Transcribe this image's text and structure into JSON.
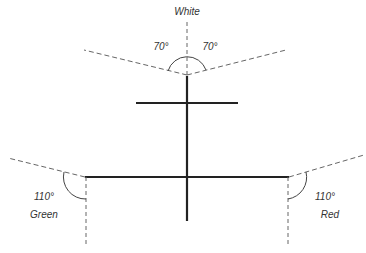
{
  "diagram": {
    "labels": {
      "top_light": "White",
      "left_light": "Green",
      "right_light": "Red",
      "top_left_angle": "70°",
      "top_right_angle": "70°",
      "left_angle": "110°",
      "right_angle": "110°"
    },
    "colors": {
      "solid_line": "#222222",
      "dashed_line": "#666666",
      "text": "#333333"
    }
  }
}
